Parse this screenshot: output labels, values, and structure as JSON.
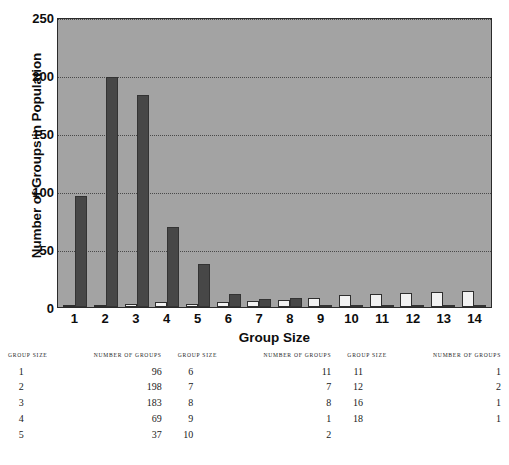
{
  "chart_data": {
    "type": "bar",
    "title": "",
    "xlabel": "Group Size",
    "ylabel": "Number of Groups in Population",
    "categories": [
      "1",
      "2",
      "3",
      "4",
      "5",
      "6",
      "7",
      "8",
      "9",
      "10",
      "11",
      "12",
      "13",
      "14"
    ],
    "ylim": [
      0,
      250
    ],
    "yticks": [
      0,
      50,
      100,
      150,
      200,
      250
    ],
    "grid": true,
    "legend_position": "none",
    "series": [
      {
        "name": "light-series",
        "color": "#f2f2f2",
        "values": [
          0,
          2,
          3,
          4,
          3,
          4,
          5,
          6,
          8,
          10,
          11,
          12,
          13,
          14
        ]
      },
      {
        "name": "dark-series",
        "color": "#474747",
        "values": [
          96,
          198,
          183,
          69,
          37,
          11,
          7,
          8,
          1,
          2,
          1,
          2,
          1,
          1
        ]
      }
    ]
  },
  "figure": {
    "ylabel": "Number of Groups in Population",
    "xlabel": "Group Size",
    "ytick_labels": [
      "250",
      "200",
      "150",
      "100",
      "50",
      "0"
    ],
    "xtick_labels": [
      "1",
      "2",
      "3",
      "4",
      "5",
      "6",
      "7",
      "8",
      "9",
      "10",
      "11",
      "12",
      "13",
      "14"
    ]
  },
  "tables": [
    {
      "name": "table-left",
      "headers": [
        "GROUP SIZE",
        "NUMBER OF GROUPS"
      ],
      "rows": [
        [
          "1",
          "96"
        ],
        [
          "2",
          "198"
        ],
        [
          "3",
          "183"
        ],
        [
          "4",
          "69"
        ],
        [
          "5",
          "37"
        ]
      ]
    },
    {
      "name": "table-middle",
      "headers": [
        "GROUP SIZE",
        "NUMBER OF GROUPS"
      ],
      "rows": [
        [
          "6",
          "11"
        ],
        [
          "7",
          "7"
        ],
        [
          "8",
          "8"
        ],
        [
          "9",
          "1"
        ],
        [
          "10",
          "2"
        ]
      ]
    },
    {
      "name": "table-right",
      "headers": [
        "GROUP SIZE",
        "NUMBER OF GROUPS"
      ],
      "rows": [
        [
          "11",
          "1"
        ],
        [
          "12",
          "2"
        ],
        [
          "16",
          "1"
        ],
        [
          "18",
          "1"
        ]
      ]
    }
  ],
  "footnote": ""
}
